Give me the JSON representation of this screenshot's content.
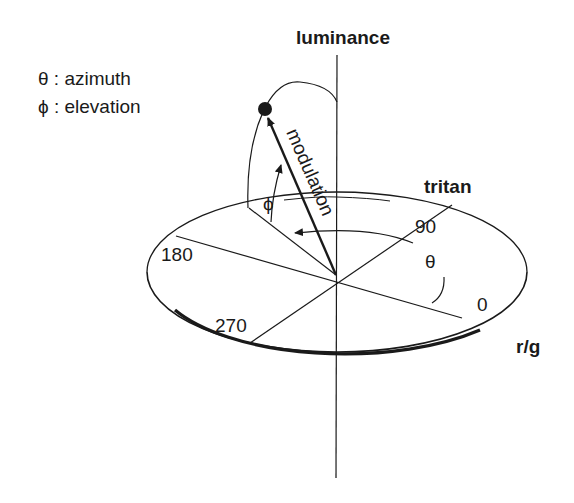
{
  "legend": [
    {
      "symbol": "θ",
      "label": "θ : azimuth"
    },
    {
      "symbol": "ϕ",
      "label": "ϕ : elevation"
    }
  ],
  "axes": {
    "vertical": "luminance",
    "depth": "tritan",
    "horizontal": "r/g"
  },
  "angle_ticks": [
    "0",
    "90",
    "180",
    "270"
  ],
  "vector_label": "modulation",
  "angle_labels": {
    "azimuth": "θ",
    "elevation": "ϕ"
  },
  "colors": {
    "ink": "#1a1a1a",
    "background": "#ffffff"
  }
}
